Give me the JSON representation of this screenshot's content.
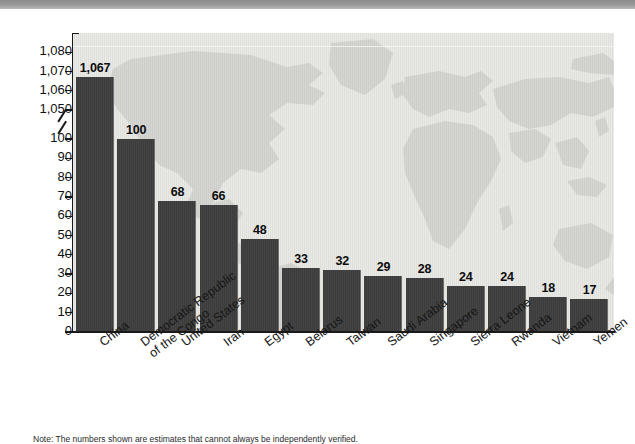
{
  "chart_data": {
    "type": "bar",
    "title": "",
    "xlabel": "",
    "ylabel": "",
    "categories": [
      "China",
      "Democratic Republic of the Congo",
      "United States",
      "Iran",
      "Egypt",
      "Belarus",
      "Taiwan",
      "Saudi Arabia",
      "Singapore",
      "Sierra Leone",
      "Rwanda",
      "Vietnam",
      "Yemen"
    ],
    "values": [
      1067,
      100,
      68,
      66,
      48,
      33,
      32,
      29,
      28,
      24,
      24,
      18,
      17
    ],
    "value_labels": [
      "1,067",
      "100",
      "68",
      "66",
      "48",
      "33",
      "32",
      "29",
      "28",
      "24",
      "24",
      "18",
      "17"
    ],
    "ylim": [
      0,
      1080
    ],
    "y_axis_broken": true,
    "y_break_between": [
      100,
      1050
    ],
    "yticks_lower": [
      0,
      10,
      20,
      30,
      40,
      50,
      60,
      70,
      80,
      90,
      100
    ],
    "yticks_upper": [
      1050,
      1060,
      1070,
      1080
    ],
    "ytick_labels_lower": [
      "0",
      "10",
      "20",
      "30",
      "40",
      "50",
      "60",
      "70",
      "80",
      "90",
      "100"
    ],
    "ytick_labels_upper": [
      "1,050",
      "1,060",
      "1,070",
      "1,080"
    ],
    "grid": false,
    "legend": null,
    "bar_color": "#3c3c3c",
    "plot_background": "#e9e9e6",
    "background_image": "world-map-watermark"
  },
  "footnote": {
    "text": "Note: The numbers shown are estimates that cannot always be independently verified."
  },
  "category_label_lines": [
    [
      "China"
    ],
    [
      "Democratic Republic",
      "of the Congo"
    ],
    [
      "United States"
    ],
    [
      "Iran"
    ],
    [
      "Egypt"
    ],
    [
      "Belarus"
    ],
    [
      "Taiwan"
    ],
    [
      "Saudi Arabia"
    ],
    [
      "Singapore"
    ],
    [
      "Sierra Leone"
    ],
    [
      "Rwanda"
    ],
    [
      "Vietnam"
    ],
    [
      "Yemen"
    ]
  ]
}
